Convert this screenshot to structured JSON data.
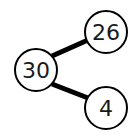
{
  "diagram": {
    "type": "number-bond",
    "whole": {
      "label": "30",
      "cx": 36,
      "cy": 70,
      "r": 22
    },
    "parts": [
      {
        "label": "26",
        "cx": 106,
        "cy": 32,
        "r": 22
      },
      {
        "label": "4",
        "cx": 106,
        "cy": 108,
        "r": 22
      }
    ],
    "colors": {
      "stroke": "#000000",
      "fill": "#ffffff",
      "text": "#1a1a1a"
    }
  }
}
